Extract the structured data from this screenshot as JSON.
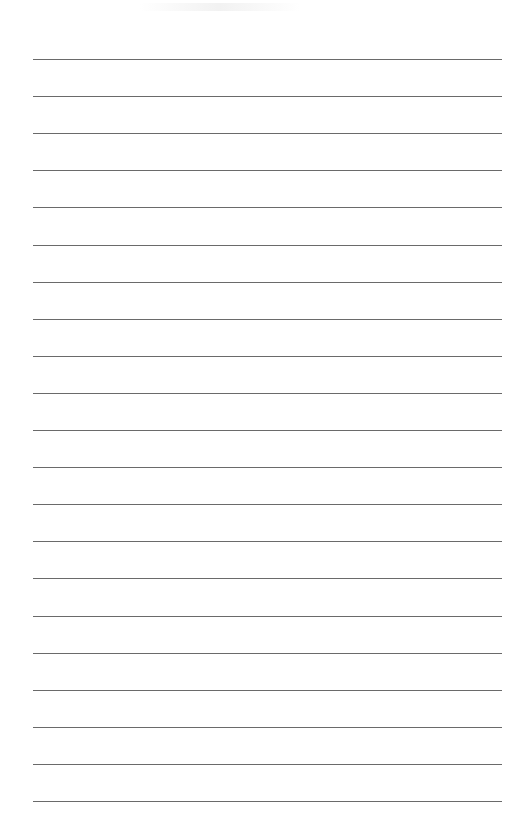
{
  "page": {
    "type": "lined-paper",
    "background_color": "#ffffff",
    "rule_color": "#6a6a6a",
    "rule_count": 21,
    "rule_left": 33,
    "rule_right": 502,
    "first_rule_y": 59,
    "rule_spacing": 37.1
  },
  "text": []
}
